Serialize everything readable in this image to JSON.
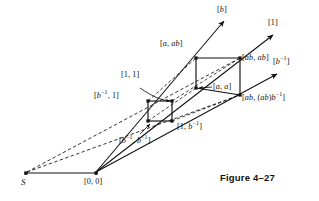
{
  "figure": {
    "caption": "Figure 4–27",
    "origin_label": "[0, 0]",
    "source_label": "S",
    "ray_labels": {
      "b": "[b]",
      "one": "[1]",
      "b_inv": "[b⁻¹]"
    },
    "vertex_labels": {
      "a_ab": "[a, ab]",
      "ab_ab": "[ab, ab]",
      "one_one": "[1, 1]",
      "a_a": "[a, a]",
      "binv_one": "[b⁻¹, 1]",
      "ab_abbinv": "[ab, (ab)b⁻¹]",
      "one_binv": "[1, b⁻¹]",
      "binv_binv": "[b⁻¹, b⁻¹]"
    },
    "colors": {
      "ink": "#111111",
      "background": "#ffffff"
    },
    "geometry": {
      "source_point": [
        25,
        173
      ],
      "origin_point": [
        96,
        173
      ],
      "ray_tips": {
        "b": [
          226,
          19
        ],
        "one": [
          275,
          33
        ],
        "b_inv": [
          279,
          72
        ]
      },
      "small_square": [
        [
          148,
          101
        ],
        [
          172,
          101
        ],
        [
          172,
          121
        ],
        [
          148,
          121
        ]
      ],
      "large_rect": [
        [
          196,
          58
        ],
        [
          240,
          58
        ],
        [
          240,
          95
        ],
        [
          196,
          88
        ]
      ]
    }
  }
}
